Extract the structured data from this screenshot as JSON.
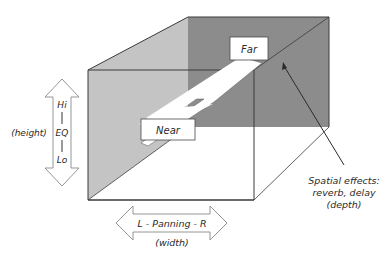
{
  "diagram": {
    "type": "3d-mix-space",
    "colors": {
      "back_wall": "#8c8c8c",
      "left_wall": "#c4c4c4",
      "edge": "#3a3a3a",
      "box_fill": "#ffffff",
      "text": "#2a2a2a"
    },
    "boxes": {
      "far": "Far",
      "near": "Near"
    },
    "height_axis": {
      "top": "Hi",
      "middle": "EQ",
      "bottom": "Lo",
      "caption": "(height)"
    },
    "width_axis": {
      "label": "L - Panning - R",
      "caption": "(width)"
    },
    "depth_annotation": {
      "line1": "Spatial effects:",
      "line2": "reverb, delay",
      "line3": "(depth)"
    }
  }
}
